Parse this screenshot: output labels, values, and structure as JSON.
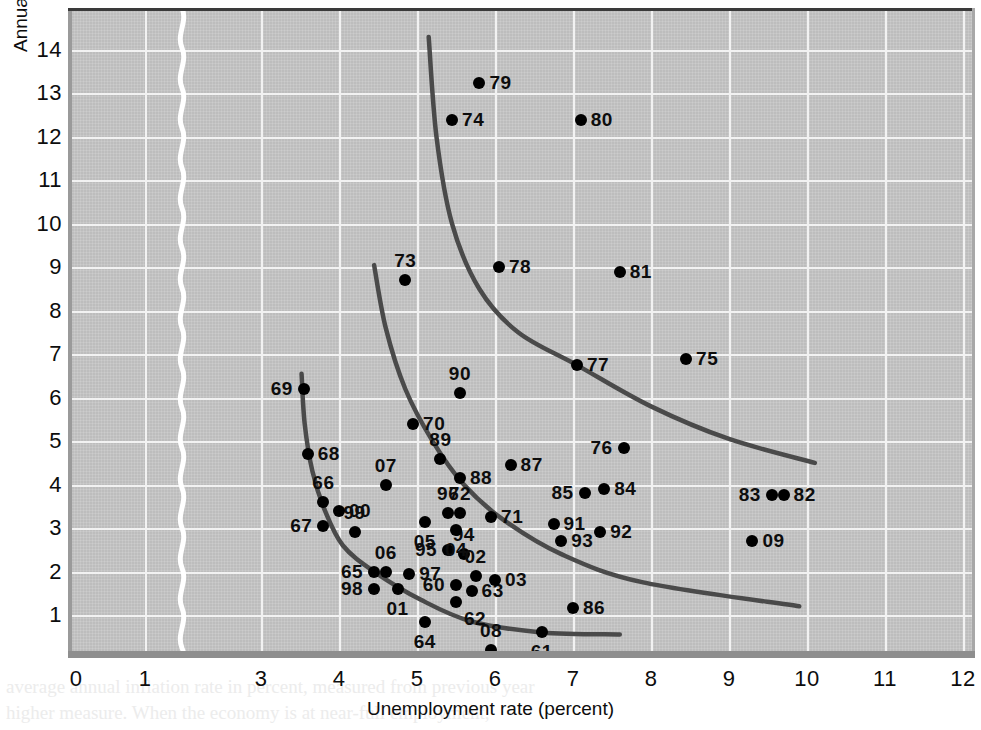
{
  "chart_data": {
    "type": "scatter",
    "title": "",
    "xlabel": "Unemployment rate (percent)",
    "ylabel": "Annual rate of inflation (percent)",
    "xlim": [
      0,
      12.6
    ],
    "ylim": [
      0,
      14.6
    ],
    "xticks": [
      "0",
      "1",
      "3",
      "4",
      "5",
      "6",
      "7",
      "8",
      "9",
      "10",
      "11",
      "12"
    ],
    "yticks": [
      "1",
      "2",
      "3",
      "4",
      "5",
      "6",
      "7",
      "8",
      "9",
      "10",
      "11",
      "12",
      "13",
      "14"
    ],
    "grid": true,
    "legend": "none",
    "axis_break": {
      "between": [
        "1",
        "3"
      ],
      "style": "white-squiggle"
    },
    "point_color": "#000000",
    "curve_color": "#4a4a4a",
    "plot_background": "#bdbdbd",
    "gridline_color": "#f2f2f2",
    "points": [
      {
        "label": "60",
        "x": 5.5,
        "y": 1.7,
        "lpos": "left"
      },
      {
        "label": "61",
        "x": 6.6,
        "y": 0.6,
        "lpos": "below"
      },
      {
        "label": "62",
        "x": 5.5,
        "y": 1.3,
        "lpos": "belowright"
      },
      {
        "label": "63",
        "x": 5.7,
        "y": 1.55,
        "lpos": "right"
      },
      {
        "label": "64",
        "x": 5.1,
        "y": 0.85,
        "lpos": "below"
      },
      {
        "label": "65",
        "x": 4.45,
        "y": 2.0,
        "lpos": "left"
      },
      {
        "label": "66",
        "x": 3.8,
        "y": 3.6,
        "lpos": "above"
      },
      {
        "label": "67",
        "x": 3.8,
        "y": 3.05,
        "lpos": "left"
      },
      {
        "label": "68",
        "x": 3.6,
        "y": 4.7,
        "lpos": "right"
      },
      {
        "label": "69",
        "x": 3.55,
        "y": 6.2,
        "lpos": "left"
      },
      {
        "label": "70",
        "x": 4.95,
        "y": 5.4,
        "lpos": "right"
      },
      {
        "label": "71",
        "x": 5.95,
        "y": 3.25,
        "lpos": "right"
      },
      {
        "label": "72",
        "x": 5.55,
        "y": 3.35,
        "lpos": "above"
      },
      {
        "label": "73",
        "x": 4.85,
        "y": 8.7,
        "lpos": "above"
      },
      {
        "label": "74",
        "x": 5.45,
        "y": 12.4,
        "lpos": "right"
      },
      {
        "label": "75",
        "x": 8.45,
        "y": 6.9,
        "lpos": "right"
      },
      {
        "label": "76",
        "x": 7.65,
        "y": 4.85,
        "lpos": "left"
      },
      {
        "label": "77",
        "x": 7.05,
        "y": 6.75,
        "lpos": "right"
      },
      {
        "label": "78",
        "x": 6.05,
        "y": 9.0,
        "lpos": "right"
      },
      {
        "label": "79",
        "x": 5.8,
        "y": 13.25,
        "lpos": "right"
      },
      {
        "label": "80",
        "x": 7.1,
        "y": 12.4,
        "lpos": "right"
      },
      {
        "label": "81",
        "x": 7.6,
        "y": 8.9,
        "lpos": "right"
      },
      {
        "label": "82",
        "x": 9.7,
        "y": 3.75,
        "lpos": "right"
      },
      {
        "label": "83",
        "x": 9.55,
        "y": 3.75,
        "lpos": "left"
      },
      {
        "label": "84",
        "x": 7.4,
        "y": 3.9,
        "lpos": "right"
      },
      {
        "label": "85",
        "x": 7.15,
        "y": 3.8,
        "lpos": "left"
      },
      {
        "label": "86",
        "x": 7.0,
        "y": 1.15,
        "lpos": "right"
      },
      {
        "label": "87",
        "x": 6.2,
        "y": 4.45,
        "lpos": "right"
      },
      {
        "label": "88",
        "x": 5.55,
        "y": 4.15,
        "lpos": "right"
      },
      {
        "label": "89",
        "x": 5.3,
        "y": 4.6,
        "lpos": "above"
      },
      {
        "label": "90",
        "x": 5.55,
        "y": 6.1,
        "lpos": "above"
      },
      {
        "label": "91",
        "x": 6.75,
        "y": 3.1,
        "lpos": "right"
      },
      {
        "label": "92",
        "x": 7.35,
        "y": 2.9,
        "lpos": "right"
      },
      {
        "label": "93",
        "x": 6.85,
        "y": 2.7,
        "lpos": "right"
      },
      {
        "label": "94",
        "x": 5.6,
        "y": 2.4,
        "lpos": "above"
      },
      {
        "label": "95",
        "x": 5.4,
        "y": 2.5,
        "lpos": "left"
      },
      {
        "label": "96",
        "x": 5.4,
        "y": 3.35,
        "lpos": "above"
      },
      {
        "label": "97",
        "x": 4.9,
        "y": 1.95,
        "lpos": "right"
      },
      {
        "label": "98",
        "x": 4.45,
        "y": 1.6,
        "lpos": "left"
      },
      {
        "label": "99",
        "x": 4.2,
        "y": 2.9,
        "lpos": "above"
      },
      {
        "label": "00",
        "x": 4.0,
        "y": 3.4,
        "lpos": "right"
      },
      {
        "label": "01",
        "x": 4.75,
        "y": 1.6,
        "lpos": "below"
      },
      {
        "label": "02",
        "x": 5.75,
        "y": 1.9,
        "lpos": "above"
      },
      {
        "label": "03",
        "x": 6.0,
        "y": 1.8,
        "lpos": "right"
      },
      {
        "label": "04",
        "x": 5.5,
        "y": 2.95,
        "lpos": "below"
      },
      {
        "label": "05",
        "x": 5.1,
        "y": 3.15,
        "lpos": "below"
      },
      {
        "label": "06",
        "x": 4.6,
        "y": 2.0,
        "lpos": "above"
      },
      {
        "label": "07",
        "x": 4.6,
        "y": 4.0,
        "lpos": "above"
      },
      {
        "label": "08",
        "x": 5.95,
        "y": 0.2,
        "lpos": "above"
      },
      {
        "label": "09",
        "x": 9.3,
        "y": 2.7,
        "lpos": "right"
      }
    ],
    "curves": [
      {
        "name": "phillips-curve-1970s",
        "points": [
          [
            5.15,
            14.3
          ],
          [
            5.25,
            12.0
          ],
          [
            5.45,
            10.0
          ],
          [
            5.8,
            8.5
          ],
          [
            6.3,
            7.5
          ],
          [
            7.05,
            6.75
          ],
          [
            8.0,
            5.8
          ],
          [
            9.0,
            5.05
          ],
          [
            10.1,
            4.5
          ]
        ]
      },
      {
        "name": "phillips-curve-1960s-70s",
        "points": [
          [
            4.45,
            9.05
          ],
          [
            4.6,
            7.6
          ],
          [
            4.85,
            6.2
          ],
          [
            5.2,
            5.0
          ],
          [
            5.6,
            4.0
          ],
          [
            6.1,
            3.2
          ],
          [
            6.85,
            2.4
          ],
          [
            7.9,
            1.75
          ],
          [
            9.9,
            1.2
          ]
        ]
      },
      {
        "name": "phillips-curve-1960s",
        "points": [
          [
            3.52,
            6.55
          ],
          [
            3.56,
            5.4
          ],
          [
            3.66,
            4.3
          ],
          [
            3.82,
            3.4
          ],
          [
            4.05,
            2.6
          ],
          [
            4.45,
            2.0
          ],
          [
            5.05,
            1.35
          ],
          [
            5.7,
            0.85
          ],
          [
            6.6,
            0.6
          ],
          [
            7.6,
            0.55
          ]
        ]
      }
    ]
  },
  "background_text": {
    "left_fragments": [
      "14",
      "IV",
      "I",
      "I"
    ],
    "bottom_line_1": "average annual inflation rate in percent, measured from previous year",
    "bottom_line_2": "higher measure. When the economy is at near-full employment,"
  }
}
